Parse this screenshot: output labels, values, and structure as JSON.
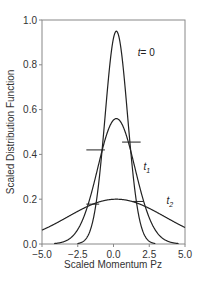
{
  "chart_data": {
    "type": "line",
    "title": "",
    "xlabel": "Scaled Momentum Pz",
    "ylabel": "Scaled Distribution Function",
    "xlim": [
      -5.0,
      5.0
    ],
    "ylim": [
      0.0,
      1.0
    ],
    "xticks": [
      -5.0,
      -2.5,
      0.0,
      2.5,
      5.0
    ],
    "xtick_labels": [
      "−5.0",
      "−2.5",
      "0.0",
      "2.5",
      "5.0"
    ],
    "yticks": [
      0.0,
      0.2,
      0.4,
      0.6,
      0.8,
      1.0
    ],
    "ytick_labels": [
      "0.0",
      "0.2",
      "0.4",
      "0.6",
      "0.8",
      "1.0"
    ],
    "grid": false,
    "series": [
      {
        "name": "t=0",
        "label_main": "t",
        "label_sub": "",
        "label_suffix": "= 0",
        "peak": 0.95,
        "center": 0.2,
        "sigma": 0.78,
        "label_pos": [
          1.7,
          0.84
        ]
      },
      {
        "name": "t1",
        "label_main": "t",
        "label_sub": "1",
        "label_suffix": "",
        "peak": 0.56,
        "center": 0.2,
        "sigma": 1.3,
        "label_pos": [
          2.1,
          0.33
        ]
      },
      {
        "name": "t2",
        "label_main": "t",
        "label_sub": "2",
        "label_suffix": "",
        "peak": 0.2,
        "center": 0.2,
        "sigma": 3.4,
        "label_pos": [
          3.7,
          0.18
        ]
      }
    ],
    "markers": [
      {
        "y": 0.42,
        "x1": -1.9,
        "x2": -0.6
      },
      {
        "y": 0.455,
        "x1": 0.6,
        "x2": 1.9
      },
      {
        "y": 0.178,
        "x1": -1.9,
        "x2": -1.0
      },
      {
        "y": 0.19,
        "x1": 1.3,
        "x2": 2.1
      }
    ]
  }
}
